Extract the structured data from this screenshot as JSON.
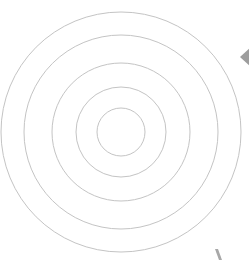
{
  "figure": {
    "background": "#ffffff",
    "rings": {
      "center": [
        121,
        132
      ],
      "radii": [
        120,
        97,
        69,
        45,
        24
      ],
      "stroke": "#c4c4c4",
      "stroke_width": 1
    },
    "diamond": {
      "points": "240,57 252,46 264,57 252,68",
      "fill": "#9d9d9d"
    },
    "mark": {
      "points": "215,249 218,249 222,260 219,260",
      "fill": "#a8a8a8"
    }
  }
}
